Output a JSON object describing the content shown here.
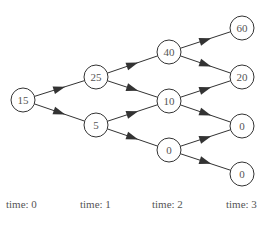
{
  "diagram": {
    "type": "binomial-tree",
    "nodes": [
      {
        "id": "n0",
        "value": "15",
        "x": 23,
        "y": 100
      },
      {
        "id": "n1u",
        "value": "25",
        "x": 96,
        "y": 77
      },
      {
        "id": "n1d",
        "value": "5",
        "x": 96,
        "y": 125
      },
      {
        "id": "n2uu",
        "value": "40",
        "x": 169,
        "y": 52
      },
      {
        "id": "n2ud",
        "value": "10",
        "x": 169,
        "y": 101
      },
      {
        "id": "n2dd",
        "value": "0",
        "x": 169,
        "y": 150
      },
      {
        "id": "n3a",
        "value": "60",
        "x": 242,
        "y": 28
      },
      {
        "id": "n3b",
        "value": "20",
        "x": 242,
        "y": 77
      },
      {
        "id": "n3c",
        "value": "0",
        "x": 242,
        "y": 126
      },
      {
        "id": "n3d",
        "value": "0",
        "x": 242,
        "y": 174
      }
    ],
    "edges": [
      [
        "n0",
        "n1u"
      ],
      [
        "n0",
        "n1d"
      ],
      [
        "n1u",
        "n2uu"
      ],
      [
        "n1u",
        "n2ud"
      ],
      [
        "n1d",
        "n2ud"
      ],
      [
        "n1d",
        "n2dd"
      ],
      [
        "n2uu",
        "n3a"
      ],
      [
        "n2uu",
        "n3b"
      ],
      [
        "n2ud",
        "n3b"
      ],
      [
        "n2ud",
        "n3c"
      ],
      [
        "n2dd",
        "n3c"
      ],
      [
        "n2dd",
        "n3d"
      ]
    ],
    "time_labels": [
      "time: 0",
      "time: 1",
      "time: 2",
      "time: 3"
    ],
    "colors": {
      "stroke": "#333333",
      "text": "#555555"
    }
  }
}
